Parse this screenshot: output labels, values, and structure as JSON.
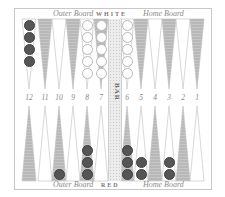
{
  "labels": {
    "top_left": "Outer Board",
    "top_center": "WHITE",
    "top_right": "Home Board",
    "bottom_left": "Outer Board",
    "bottom_center": "RED",
    "bottom_right": "Home Board",
    "bar": "BAR"
  },
  "point_numbers": [
    "12",
    "11",
    "10",
    "9",
    "8",
    "7",
    "6",
    "5",
    "4",
    "3",
    "2",
    "1"
  ],
  "colors": {
    "shaded_point": "#b8b8b8",
    "plain_point": "#ffffff",
    "white_checker": "#ffffff",
    "dark_checker": "#555555",
    "border": "#c8c8c8"
  },
  "top_row": {
    "checkers": [
      {
        "point": "12",
        "color": "black",
        "count": 4
      },
      {
        "point": "8",
        "color": "white",
        "count": 5
      },
      {
        "point": "7",
        "color": "white",
        "count": 5
      },
      {
        "point": "6",
        "color": "white",
        "count": 5
      }
    ]
  },
  "bottom_row": {
    "checkers": [
      {
        "point": "10",
        "color": "black",
        "count": 1
      },
      {
        "point": "8",
        "color": "black",
        "count": 3
      },
      {
        "point": "6",
        "color": "black",
        "count": 3
      },
      {
        "point": "5",
        "color": "black",
        "count": 2
      },
      {
        "point": "3",
        "color": "black",
        "count": 2
      }
    ]
  }
}
